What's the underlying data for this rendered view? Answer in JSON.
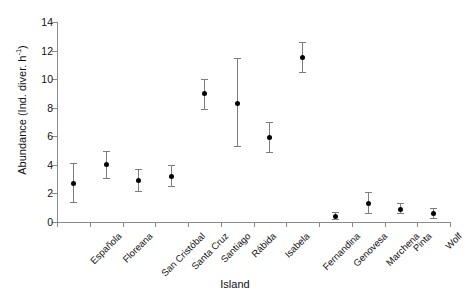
{
  "chart_data": {
    "type": "scatter",
    "title": "",
    "xlabel": "Island",
    "ylabel_text": "Abundance (Ind. diver. h",
    "ylabel_exponent": "-1",
    "ylabel_tail": ")",
    "ylabel_full": "Abundance (Ind. diver. h-1)",
    "categories": [
      "Española",
      "Floreana",
      "San Cristóbal",
      "Santa Cruz",
      "Santiago",
      "Rábida",
      "Isabela",
      "Fernandina",
      "Genovesa",
      "Marchena",
      "Pinta",
      "Wolf"
    ],
    "values": [
      2.7,
      4.0,
      2.9,
      3.2,
      9.0,
      8.3,
      5.9,
      11.5,
      0.4,
      1.3,
      0.9,
      0.6
    ],
    "error_upper": [
      4.1,
      5.0,
      3.7,
      4.0,
      10.0,
      11.5,
      7.0,
      12.6,
      0.7,
      2.1,
      1.3,
      1.0
    ],
    "error_lower": [
      1.4,
      3.1,
      2.2,
      2.5,
      7.9,
      5.3,
      4.9,
      10.5,
      0.2,
      0.6,
      0.6,
      0.3
    ],
    "ylim": [
      0,
      14
    ],
    "yticks": [
      0,
      2,
      4,
      6,
      8,
      10,
      12,
      14
    ],
    "ytick_labels": [
      "0",
      "2",
      "4",
      "6",
      "8",
      "10",
      "12",
      "14"
    ],
    "grid": false,
    "legend": false,
    "marker_color": "#000000",
    "errorbar_color": "#7d7d7d",
    "axis_color": "#8a8a8a",
    "background": "#ffffff"
  }
}
